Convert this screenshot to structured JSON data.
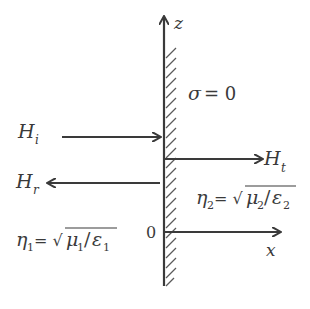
{
  "diagram": {
    "type": "electromagnetic-interface",
    "axes": {
      "vertical_label": "z",
      "horizontal_label": "x",
      "origin_label": "0"
    },
    "boundary": {
      "condition_symbol": "σ",
      "condition_eq": "= 0"
    },
    "waves": {
      "incident": {
        "symbol": "H",
        "subscript": "i"
      },
      "reflected": {
        "symbol": "H",
        "subscript": "r"
      },
      "transmitted": {
        "symbol": "H",
        "subscript": "t"
      }
    },
    "media": {
      "medium1": {
        "eta": "η",
        "eta_sub": "1",
        "eq": "= √",
        "mu": "μ",
        "mu_sub": "1",
        "slash": "/",
        "eps": "ε",
        "eps_sub": "1"
      },
      "medium2": {
        "eta": "η",
        "eta_sub": "2",
        "eq": "= √",
        "mu": "μ",
        "mu_sub": "2",
        "slash": "/",
        "eps": "ε",
        "eps_sub": "2"
      }
    },
    "colors": {
      "ink": "#3a3a3a",
      "hatch": "#5a5a5a",
      "background": "#ffffff"
    }
  }
}
